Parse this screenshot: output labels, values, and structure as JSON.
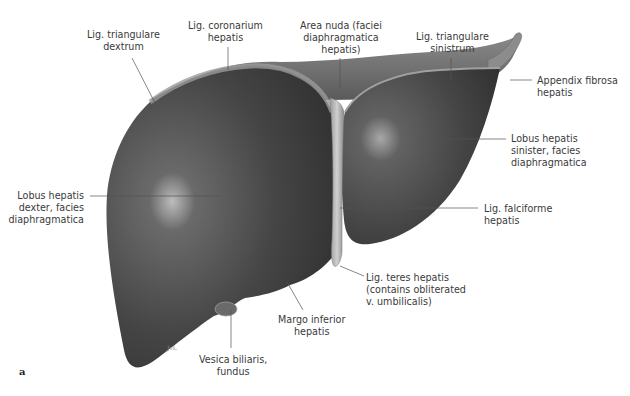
{
  "figure": {
    "panel_letter": "a",
    "colors": {
      "organ_dark": "#3b3b3b",
      "organ_mid": "#5a5a5a",
      "highlight": "#d8d8d8",
      "leader_line": "#555555",
      "background": "#ffffff"
    }
  },
  "labels": {
    "lig_triangulare_dextrum": {
      "line1": "Lig. triangulare",
      "line2": "dextrum"
    },
    "lig_coronarium": {
      "line1": "Lig. coronarium",
      "line2": "hepatis"
    },
    "area_nuda": {
      "line1": "Area nuda (faciei",
      "line2": "diaphragmatica",
      "line3": "hepatis)"
    },
    "lig_triangulare_sinistrum": {
      "line1": "Lig. triangulare",
      "line2": "sinistrum"
    },
    "appendix_fibrosa": {
      "line1": "Appendix fibrosa",
      "line2": "hepatis"
    },
    "lobus_sinister": {
      "line1": "Lobus hepatis",
      "line2": "sinister, facies",
      "line3": "diaphragmatica"
    },
    "lobus_dexter": {
      "line1": "Lobus hepatis",
      "line2": "dexter, facies",
      "line3": "diaphragmatica"
    },
    "lig_falciforme": {
      "line1": "Lig. falciforme",
      "line2": "hepatis"
    },
    "lig_teres": {
      "line1": "Lig. teres hepatis",
      "line2": "(contains obliterated",
      "line3": "v. umbilicalis)"
    },
    "margo_inferior": {
      "line1": "Margo inferior",
      "line2": "hepatis"
    },
    "vesica_biliaris": {
      "line1": "Vesica biliaris,",
      "line2": "fundus"
    }
  }
}
